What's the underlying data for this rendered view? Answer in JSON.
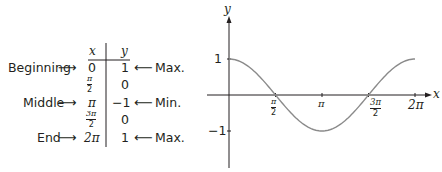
{
  "table": {
    "headers": {
      "x": "x",
      "y": "y"
    },
    "rows": [
      {
        "left_label": "Beginning",
        "x": "0",
        "y": "1",
        "right_label": "Max."
      },
      {
        "left_label": "",
        "x_num": "π",
        "x_den": "2",
        "y": "0",
        "right_label": ""
      },
      {
        "left_label": "Middle",
        "x": "π",
        "y": "−1",
        "right_label": "Min."
      },
      {
        "left_label": "",
        "x_num": "3π",
        "x_den": "2",
        "y": "0",
        "right_label": ""
      },
      {
        "left_label": "End",
        "x": "2π",
        "y": "1",
        "right_label": "Max."
      }
    ],
    "arrow_right": "⟶",
    "arrow_left": "⟵"
  },
  "graph": {
    "x_axis_label": "x",
    "y_axis_label": "y",
    "y_ticks": [
      "1",
      "−1"
    ],
    "x_ticks": [
      {
        "num": "π",
        "den": "2"
      },
      {
        "label": "π"
      },
      {
        "num": "3π",
        "den": "2"
      },
      {
        "label": "2π"
      }
    ]
  },
  "chart_data": {
    "type": "line",
    "title": "",
    "function": "y = cos x",
    "xlabel": "x",
    "ylabel": "y",
    "x": [
      "0",
      "π/2",
      "π",
      "3π/2",
      "2π"
    ],
    "series": [
      {
        "name": "cos x",
        "values": [
          1,
          0,
          -1,
          0,
          1
        ]
      }
    ],
    "x_tick_labels": [
      "π/2",
      "π",
      "3π/2",
      "2π"
    ],
    "y_tick_labels": [
      "1",
      "−1"
    ],
    "xlim": [
      0,
      6.2832
    ],
    "ylim": [
      -1,
      1
    ],
    "grid": false,
    "legend": "none"
  },
  "colors": {
    "curve": "#8a8a8a",
    "axis": "#231f20",
    "text": "#231f20"
  }
}
